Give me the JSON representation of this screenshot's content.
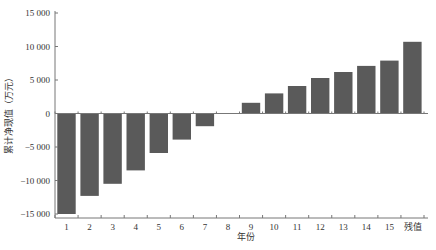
{
  "chart_data": {
    "type": "bar",
    "title": "",
    "xlabel": "年份",
    "ylabel": "累计净现值（万元）",
    "categories": [
      "1",
      "2",
      "3",
      "4",
      "5",
      "6",
      "7",
      "8",
      "9",
      "10",
      "11",
      "12",
      "13",
      "14",
      "15",
      "残值"
    ],
    "values": [
      -15000,
      -12300,
      -10500,
      -8500,
      -5900,
      -3900,
      -1900,
      0,
      1600,
      3000,
      4100,
      5300,
      6200,
      7100,
      7900,
      10700
    ],
    "ylim": [
      -15000,
      15000
    ],
    "yticks": [
      15000,
      10000,
      5000,
      0,
      -5000,
      -10000,
      -15000
    ],
    "ytick_labels": [
      "15 000",
      "10 000",
      "5 000",
      "0",
      "−5 000",
      "−10 000",
      "−15 000"
    ],
    "grid": false,
    "legend": null,
    "bar_color": "#5a5a5a"
  }
}
